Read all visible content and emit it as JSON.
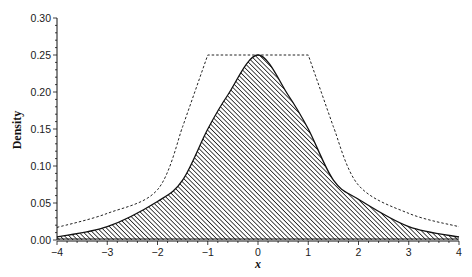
{
  "chart_data": {
    "type": "area",
    "title": "",
    "xlabel": "x",
    "ylabel": "Density",
    "xlim": [
      -4,
      4
    ],
    "ylim": [
      0,
      0.3
    ],
    "x_ticks": [
      "-4",
      "-3",
      "-2",
      "-1",
      "0",
      "1",
      "2",
      "3",
      "4"
    ],
    "y_ticks": [
      "0.00",
      "0.05",
      "0.10",
      "0.15",
      "0.20",
      "0.25",
      "0.30"
    ],
    "grid": false,
    "legend": null,
    "series": [
      {
        "name": "density (shaded, hatched)",
        "style": "solid line, diagonal hatch fill",
        "x": [
          -4,
          -3,
          -2,
          -1.5,
          -1,
          -0.6,
          0,
          0.6,
          1,
          1.5,
          2,
          3,
          4
        ],
        "values": [
          0.004,
          0.018,
          0.052,
          0.081,
          0.15,
          0.196,
          0.25,
          0.196,
          0.15,
          0.081,
          0.055,
          0.018,
          0.004
        ]
      },
      {
        "name": "envelope (dashed)",
        "style": "dashed line",
        "x": [
          -4,
          -3,
          -2,
          -1.5,
          -1,
          1,
          1.5,
          2,
          3,
          4
        ],
        "values": [
          0.017,
          0.036,
          0.068,
          0.153,
          0.25,
          0.25,
          0.153,
          0.074,
          0.036,
          0.018
        ]
      }
    ]
  }
}
